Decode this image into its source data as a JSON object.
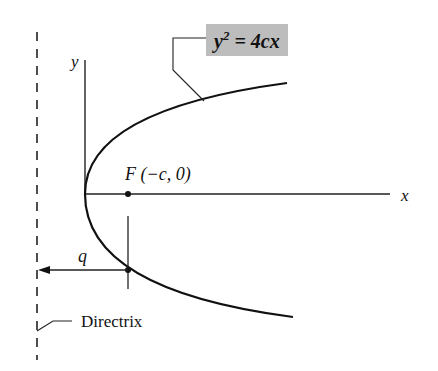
{
  "diagram": {
    "type": "parabola-focus-directrix",
    "equation_label": {
      "base": "y",
      "exponent": "2",
      "rest": " = 4cx"
    },
    "axes": {
      "x_label": "x",
      "y_label": "y"
    },
    "focus_label": "F (−c, 0)",
    "distance_label": "q",
    "directrix_label": "Directrix",
    "colors": {
      "stroke": "#111111",
      "equation_highlight": "#bdbdbd"
    }
  }
}
